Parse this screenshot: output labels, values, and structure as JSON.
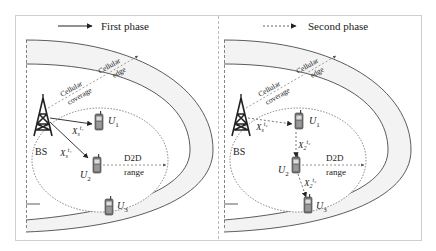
{
  "legend": {
    "first_phase": "First phase",
    "second_phase": "Second phase"
  },
  "panels": [
    {
      "id": "first",
      "bs_label": "BS",
      "cellular_coverage": [
        "Cellular",
        "coverage"
      ],
      "cellular_edge": [
        "Cellular",
        "edge"
      ],
      "d2d_range": [
        "D2D",
        "range"
      ],
      "users": {
        "u1": "U",
        "u1_sub": "1",
        "u2": "U",
        "u2_sub": "2",
        "u3": "U",
        "u3_sub": "3"
      },
      "links": [
        {
          "label": "X",
          "sub": "s",
          "sup": "t₁",
          "from": "BS",
          "to": "U1"
        },
        {
          "label": "X",
          "sub": "s",
          "sup": "t₁",
          "from": "BS",
          "to": "U2"
        }
      ]
    },
    {
      "id": "second",
      "bs_label": "BS",
      "cellular_coverage": [
        "Cellular",
        "coverage"
      ],
      "cellular_edge": [
        "Cellular",
        "edge"
      ],
      "d2d_range": [
        "D2D",
        "range"
      ],
      "users": {
        "u1": "U",
        "u1_sub": "1",
        "u2": "U",
        "u2_sub": "2",
        "u3": "U",
        "u3_sub": "3"
      },
      "links": [
        {
          "label": "X",
          "sub": "s",
          "sup": "t₂",
          "from": "BS",
          "to": "U1"
        },
        {
          "label": "X",
          "sub": "2",
          "sup": "t₂",
          "from": "U1",
          "to": "U2"
        },
        {
          "label": "X",
          "sub": "2",
          "sup": "t₂",
          "from": "U2",
          "to": "U3"
        }
      ]
    }
  ],
  "colors": {
    "line": "#333333",
    "band": "#f3f3f3",
    "frame": "#cfcfcf"
  }
}
